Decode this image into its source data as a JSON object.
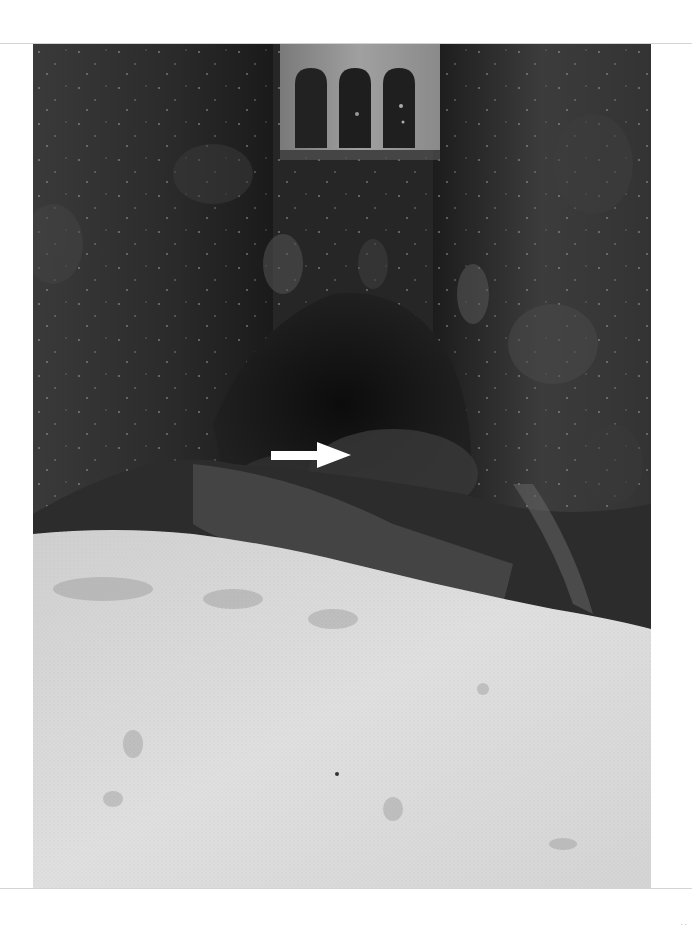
{
  "figure": {
    "kind": "grayscale surgical photograph",
    "elements": {
      "retractor": "metal retractor with three slots at top center",
      "arrow": {
        "direction": "right",
        "color": "#ffffff"
      },
      "gauze": "white surgical gauze covering lower portion"
    },
    "colors": {
      "tissue_dark": "#1e1e1e",
      "tissue_mid": "#4a4a4a",
      "retractor": "#8c8c8c",
      "gauze": "#d9d9d9",
      "page_bg": "#ffffff"
    }
  },
  "page": {
    "page_number": "··"
  }
}
